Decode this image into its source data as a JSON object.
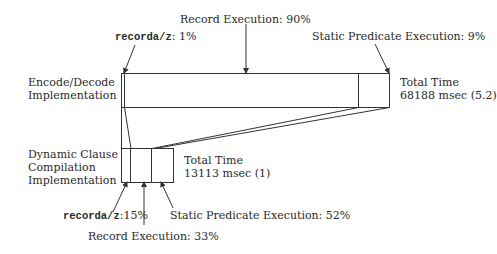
{
  "top_bar": {
    "row_label_line1": "Encode/Decode",
    "row_label_line2": "Implementation",
    "total_line1": "Total Time",
    "total_line2": "68188 msec (5.2)",
    "callouts": {
      "recorda_prefix": "recorda/z",
      "recorda_suffix": ": 1%",
      "record_execution": "Record Execution: 90%",
      "static_predicate": "Static Predicate Execution: 9%"
    }
  },
  "bottom_bar": {
    "row_label_line1": "Dynamic Clause",
    "row_label_line2": "Compilation",
    "row_label_line3": "Implementation",
    "total_line1": "Total Time",
    "total_line2": "13113 msec (1)",
    "callouts": {
      "recorda_prefix": "recorda/z",
      "recorda_suffix": ":15%",
      "record_execution": "Record Execution: 33%",
      "static_predicate": "Static Predicate Execution: 52%"
    }
  },
  "segments": {
    "encode_decode": [
      {
        "name": "recorda/z",
        "percent": 1
      },
      {
        "name": "Record Execution",
        "percent": 90
      },
      {
        "name": "Static Predicate Execution",
        "percent": 9
      }
    ],
    "dynamic_clause": [
      {
        "name": "recorda/z",
        "percent": 15
      },
      {
        "name": "Record Execution",
        "percent": 33
      },
      {
        "name": "Static Predicate Execution",
        "percent": 52
      }
    ]
  },
  "colors": {
    "line": "#333333",
    "background": "#ffffff"
  }
}
